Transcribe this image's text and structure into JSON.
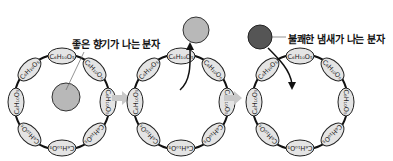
{
  "diagram": {
    "labels": {
      "good_molecule": "좋은 향기가 나는 분자",
      "bad_molecule": "불쾌한 냄새가 나는 분자"
    },
    "ring_unit_label": "C₆H₁₀O₅",
    "panels": [
      {
        "name": "panel-1",
        "state": "good-smell molecule inside ring"
      },
      {
        "name": "panel-2",
        "state": "good-smell molecule released"
      },
      {
        "name": "panel-3",
        "state": "bad-smell molecule entering ring"
      }
    ],
    "colors": {
      "good_molecule": "#b8b8b8",
      "bad_molecule": "#555555",
      "ring_unit_fill": "#e4e4e4",
      "arrow_gray": "#c8c8c8"
    }
  }
}
